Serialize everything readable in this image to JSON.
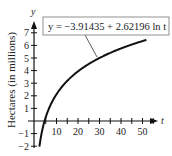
{
  "chart_data": {
    "type": "line",
    "title": "",
    "xlabel": "t",
    "ylabel": "Hectares (in millions)",
    "y_axis_var": "y",
    "equation": "y = −3.91435 + 2.62196 ln t",
    "x_ticks": [
      10,
      20,
      30,
      40,
      50
    ],
    "y_ticks": [
      -2,
      -1,
      1,
      2,
      3,
      4,
      5,
      6,
      7
    ],
    "xlim": [
      0,
      55
    ],
    "ylim": [
      -2.3,
      7.8
    ],
    "grid": false,
    "series": [
      {
        "name": "y = −3.91435 + 2.62196 ln t",
        "function": "-3.91435 + 2.62196*ln(t)",
        "x": [
          2.1,
          3,
          4,
          5,
          6,
          8,
          10,
          15,
          20,
          25,
          30,
          35,
          40,
          45,
          50,
          52
        ],
        "values": [
          -1.97,
          -1.03,
          -0.28,
          0.31,
          0.78,
          1.54,
          2.12,
          3.19,
          3.94,
          4.52,
          5.0,
          5.41,
          5.76,
          6.07,
          6.34,
          6.45
        ]
      }
    ],
    "color": "#111111"
  }
}
